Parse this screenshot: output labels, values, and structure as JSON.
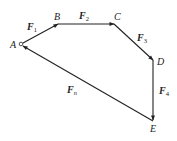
{
  "diagram": {
    "type": "force-polygon",
    "points": {
      "A": {
        "label": "A",
        "x": 21,
        "y": 44
      },
      "B": {
        "label": "B",
        "x": 58,
        "y": 24
      },
      "C": {
        "label": "C",
        "x": 114,
        "y": 24
      },
      "D": {
        "label": "D",
        "x": 153,
        "y": 60
      },
      "E": {
        "label": "E",
        "x": 153,
        "y": 121
      }
    },
    "vectors": [
      {
        "id": "F1",
        "symbol": "F",
        "subscript": "1",
        "from": "A",
        "to": "B"
      },
      {
        "id": "F2",
        "symbol": "F",
        "subscript": "2",
        "from": "B",
        "to": "C"
      },
      {
        "id": "F3",
        "symbol": "F",
        "subscript": "3",
        "from": "C",
        "to": "D"
      },
      {
        "id": "F4",
        "symbol": "F",
        "subscript": "4",
        "from": "D",
        "to": "E"
      },
      {
        "id": "Fn",
        "symbol": "F",
        "subscript": "n",
        "from": "E",
        "to": "A"
      }
    ],
    "colors": {
      "line": "#222222",
      "background": "#ffffff"
    }
  }
}
